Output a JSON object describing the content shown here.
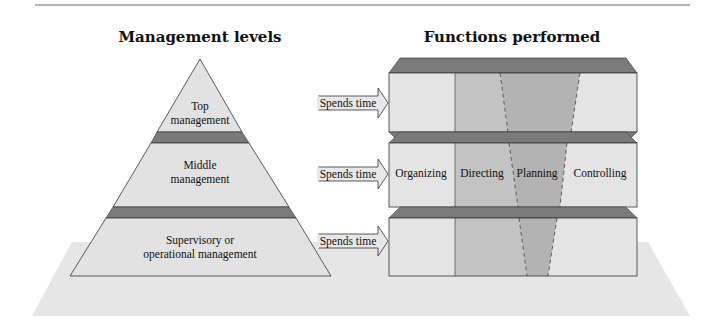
{
  "diagram": {
    "left_title": "Management levels",
    "right_title": "Functions performed",
    "levels": [
      {
        "line1": "Top",
        "line2": "management"
      },
      {
        "line1": "Middle",
        "line2": "management"
      },
      {
        "line1": "Supervisory or",
        "line2": "operational management"
      }
    ],
    "arrow_label": "Spends time",
    "functions": [
      "Organizing",
      "Directing",
      "Planning",
      "Controlling"
    ],
    "colors": {
      "face_light": "#e4e4e4",
      "directing": "#c3c3c3",
      "planning": "#b3b3b3",
      "band_dark": "#7a7a7a",
      "shadow": "#e8e8e8",
      "outline": "#333333"
    }
  }
}
